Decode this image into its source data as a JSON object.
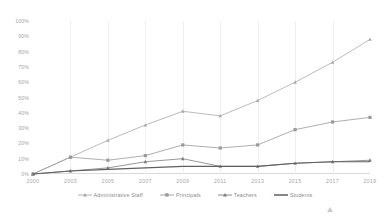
{
  "title_faint": "",
  "axis": {
    "y_ticks": [
      "100%",
      "90%",
      "80%",
      "70%",
      "60%",
      "50%",
      "40%",
      "30%",
      "20%",
      "10%",
      "0%"
    ],
    "x_ticks": [
      "2000",
      "2003",
      "2005",
      "2007",
      "2009",
      "2011",
      "2013",
      "2015",
      "2017",
      "2019"
    ]
  },
  "legend": {
    "items": [
      {
        "label": "Administrative Staff",
        "marker": "triangle-marker",
        "color": "#a9a9ad"
      },
      {
        "label": "Principals",
        "marker": "square-marker",
        "color": "#9a9a9e"
      },
      {
        "label": "Teachers",
        "marker": "triangle-marker",
        "color": "#7d7d82"
      },
      {
        "label": "Students",
        "marker": "line-marker",
        "color": "#5f5f64"
      }
    ]
  },
  "cursor": {
    "name": "mouse-pointer"
  },
  "chart_data": {
    "type": "line",
    "title": "",
    "xlabel": "",
    "ylabel": "",
    "ylim": [
      0,
      100
    ],
    "ytick_step": 10,
    "grid": "vertical-only",
    "legend_position": "bottom",
    "categories": [
      "2000",
      "2003",
      "2005",
      "2007",
      "2009",
      "2011",
      "2013",
      "2015",
      "2017",
      "2019"
    ],
    "series": [
      {
        "name": "Administrative Staff",
        "color": "#a9a9ad",
        "marker": "triangle",
        "values": [
          0,
          11,
          22,
          32,
          41,
          38,
          48,
          60,
          73,
          88
        ]
      },
      {
        "name": "Principals",
        "color": "#9a9a9e",
        "marker": "square",
        "values": [
          0,
          11,
          9,
          12,
          19,
          17,
          19,
          29,
          34,
          37
        ]
      },
      {
        "name": "Teachers",
        "color": "#7d7d82",
        "marker": "triangle",
        "values": [
          0,
          2,
          4,
          8,
          10,
          5,
          5,
          7,
          8,
          9
        ]
      },
      {
        "name": "Students",
        "color": "#5f5f64",
        "marker": "none",
        "values": [
          0,
          2,
          3,
          4,
          5,
          5,
          5,
          7,
          8,
          8
        ]
      }
    ]
  }
}
